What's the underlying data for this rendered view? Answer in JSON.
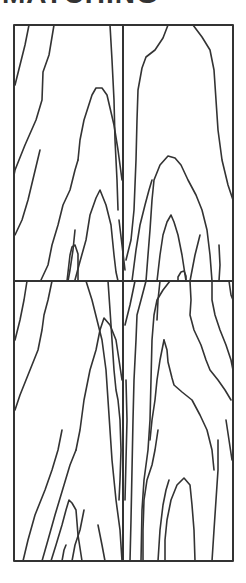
{
  "header": {
    "title_fragment": "MATCHING"
  },
  "figure": {
    "layout": {
      "rows": 2,
      "cols": 2
    },
    "stroke_color": "#333333",
    "background_color": "#ffffff",
    "frame": {
      "x": 14,
      "y": 25,
      "width": 219,
      "height": 536
    },
    "dividers": {
      "vertical_x": 123,
      "horizontal_y": 281
    },
    "panels": [
      {
        "id": "top-left",
        "label": ""
      },
      {
        "id": "top-right",
        "label": ""
      },
      {
        "id": "bottom-left",
        "label": ""
      },
      {
        "id": "bottom-right",
        "label": ""
      }
    ]
  }
}
